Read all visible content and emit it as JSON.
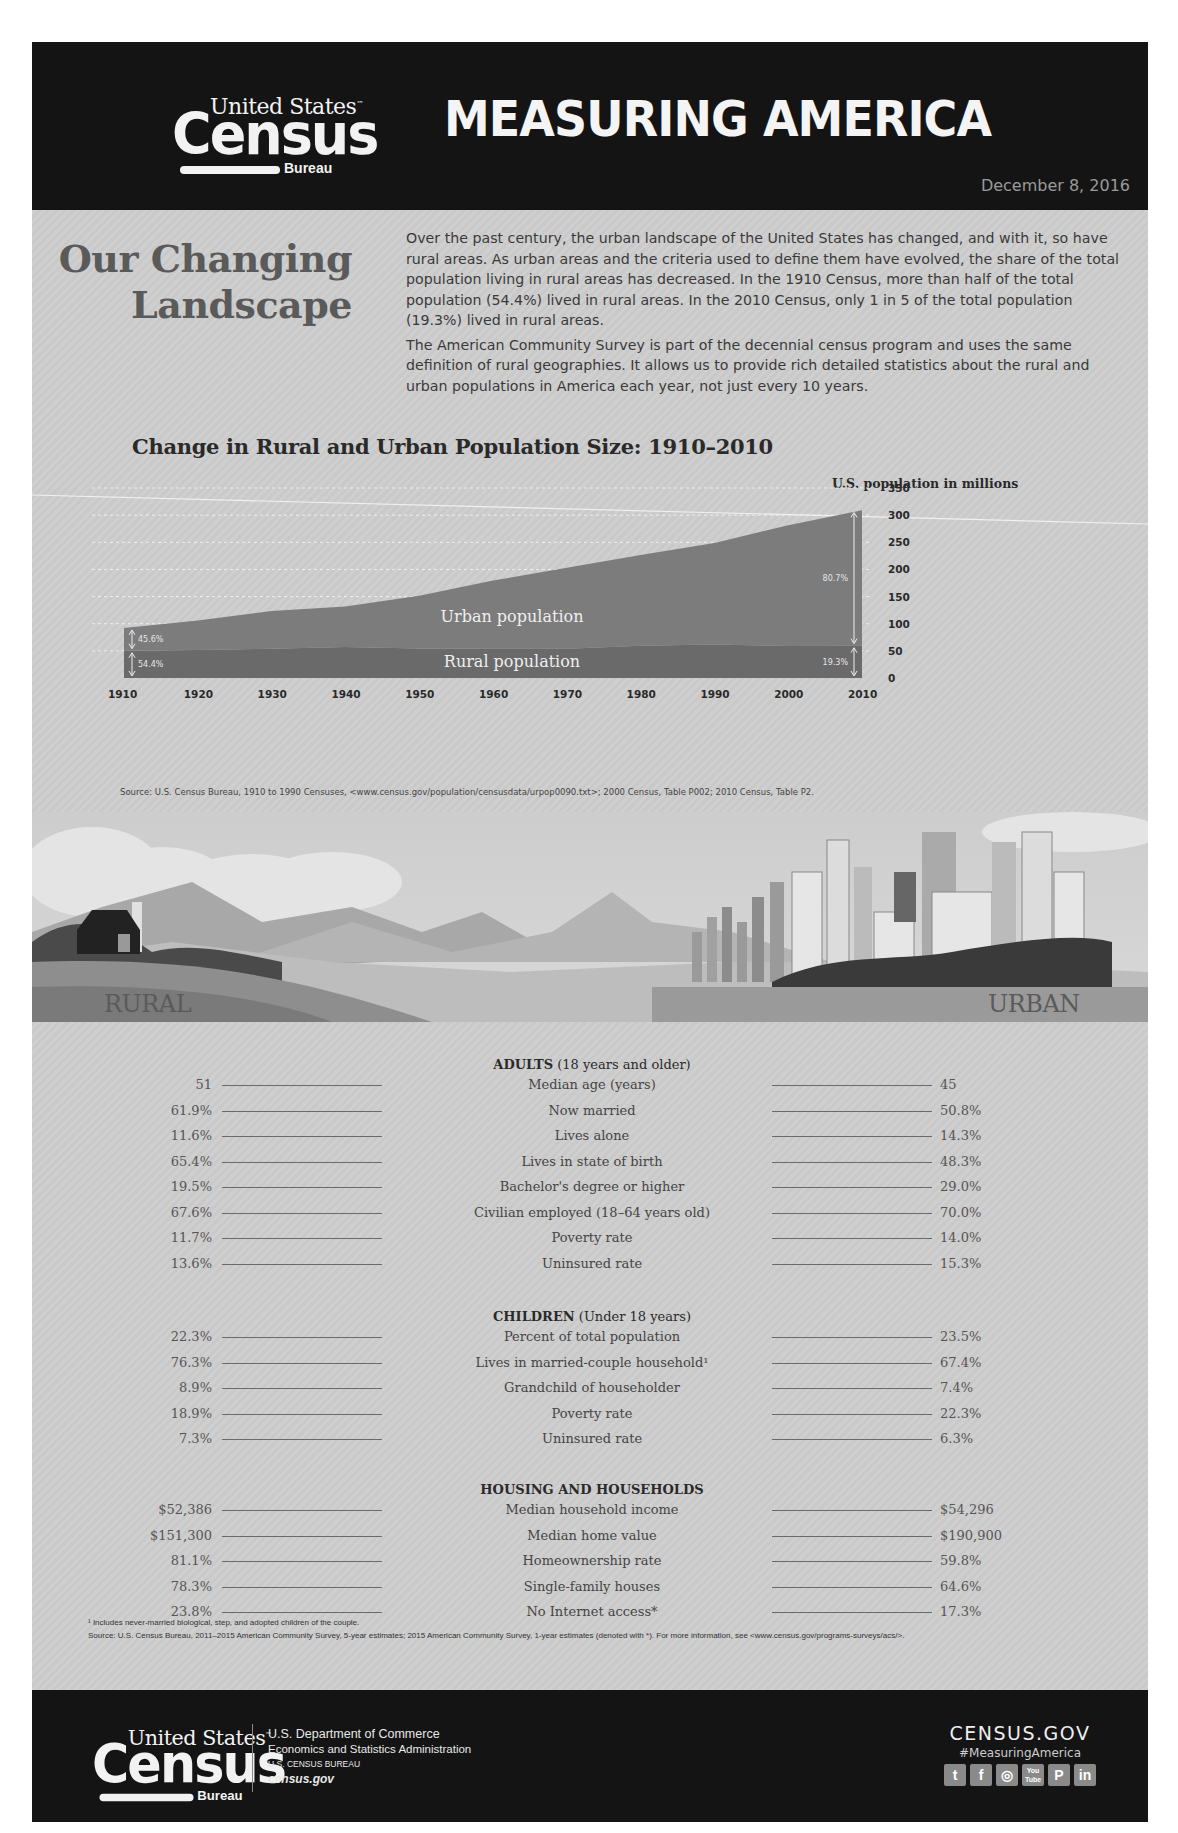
{
  "header": {
    "logo": {
      "line1": "United States",
      "tm": "™",
      "line2": "Census",
      "line3": "Bureau"
    },
    "title": "MEASURING AMERICA",
    "date": "December 8, 2016"
  },
  "intro": {
    "heading_line1": "Our Changing",
    "heading_line2": "Landscape",
    "paragraph1": "Over the past century, the urban landscape of the United States has changed, and with it, so have rural areas. As urban areas and the criteria used to define them have evolved, the share of the total population living in rural areas has decreased. In the 1910 Census, more than half of the total population (54.4%) lived in rural areas. In the 2010 Census, only 1 in 5 of the total population (19.3%) lived in rural areas.",
    "paragraph2": "The American Community Survey is part of the decennial census program and uses the same definition of rural geographies. It allows us to provide rich detailed statistics about the rural and urban populations in America each year, not just every 10 years."
  },
  "chart_data": {
    "type": "area",
    "title": "Change in Rural and Urban Population Size: 1910–2010",
    "xlabel": "",
    "ylabel": "U.S. population in millions",
    "x": [
      1910,
      1920,
      1930,
      1940,
      1950,
      1960,
      1970,
      1980,
      1990,
      2000,
      2010
    ],
    "x_tick_labels": [
      "1910",
      "1920",
      "1930",
      "1940",
      "1950",
      "1960",
      "1970",
      "1980",
      "1990",
      "2000",
      "2010"
    ],
    "y_tick_labels": [
      "0",
      "50",
      "100",
      "150",
      "200",
      "250",
      "300",
      "350"
    ],
    "ylim": [
      0,
      350
    ],
    "stacked": true,
    "grid": "dashed horizontal",
    "series": [
      {
        "name": "Rural population",
        "values": [
          50.2,
          51.6,
          54.0,
          57.2,
          54.5,
          54.1,
          53.9,
          59.5,
          61.7,
          59.1,
          59.5
        ]
      },
      {
        "name": "Urban population",
        "values": [
          42.1,
          54.3,
          69.2,
          74.7,
          96.8,
          125.3,
          149.3,
          167.1,
          187.1,
          222.4,
          249.3
        ]
      }
    ],
    "annotations": [
      {
        "year": 1910,
        "series": "Urban population",
        "label": "45.6%"
      },
      {
        "year": 1910,
        "series": "Rural population",
        "label": "54.4%"
      },
      {
        "year": 2010,
        "series": "Urban population",
        "label": "80.7%"
      },
      {
        "year": 2010,
        "series": "Rural population",
        "label": "19.3%"
      }
    ],
    "source": "Source: U.S. Census Bureau, 1910 to 1990 Censuses, <www.census.gov/population/censusdata/urpop0090.txt>; 2000 Census, Table P002; 2010 Census, Table P2."
  },
  "comparison": {
    "rural_header": "RURAL",
    "urban_header": "URBAN",
    "sections": [
      {
        "title_bold": "ADULTS",
        "title_rest": " (18 years and older)",
        "rows": [
          {
            "label": "Median age (years)",
            "rural": "51",
            "urban": "45"
          },
          {
            "label": "Now married",
            "rural": "61.9%",
            "urban": "50.8%"
          },
          {
            "label": "Lives alone",
            "rural": "11.6%",
            "urban": "14.3%"
          },
          {
            "label": "Lives in state of birth",
            "rural": "65.4%",
            "urban": "48.3%"
          },
          {
            "label": "Bachelor's degree or higher",
            "rural": "19.5%",
            "urban": "29.0%"
          },
          {
            "label": "Civilian employed (18–64 years old)",
            "rural": "67.6%",
            "urban": "70.0%"
          },
          {
            "label": "Poverty rate",
            "rural": "11.7%",
            "urban": "14.0%"
          },
          {
            "label": "Uninsured rate",
            "rural": "13.6%",
            "urban": "15.3%"
          }
        ]
      },
      {
        "title_bold": "CHILDREN",
        "title_rest": " (Under 18 years)",
        "rows": [
          {
            "label": "Percent of total population",
            "rural": "22.3%",
            "urban": "23.5%"
          },
          {
            "label": "Lives in married-couple household¹",
            "rural": "76.3%",
            "urban": "67.4%"
          },
          {
            "label": "Grandchild of householder",
            "rural": "8.9%",
            "urban": "7.4%"
          },
          {
            "label": "Poverty rate",
            "rural": "18.9%",
            "urban": "22.3%"
          },
          {
            "label": "Uninsured rate",
            "rural": "7.3%",
            "urban": "6.3%"
          }
        ]
      },
      {
        "title_bold": "HOUSING AND HOUSEHOLDS",
        "title_rest": "",
        "rows": [
          {
            "label": "Median household income",
            "rural": "$52,386",
            "urban": "$54,296"
          },
          {
            "label": "Median home value",
            "rural": "$151,300",
            "urban": "$190,900"
          },
          {
            "label": "Homeownership rate",
            "rural": "81.1%",
            "urban": "59.8%"
          },
          {
            "label": "Single-family houses",
            "rural": "78.3%",
            "urban": "64.6%"
          },
          {
            "label": "No Internet access*",
            "rural": "23.8%",
            "urban": "17.3%"
          }
        ]
      }
    ],
    "footnote": "¹ Includes never-married biological, step, and adopted children of the couple.",
    "source": "Source: U.S. Census Bureau, 2011–2015 American Community Survey, 5-year estimates; 2015 American Community Survey, 1-year estimates (denoted with *). For more information, see <www.census.gov/programs-surveys/acs/>."
  },
  "footer": {
    "logo": {
      "line1": "United States",
      "tm": "™",
      "line2": "Census",
      "line3": "Bureau"
    },
    "dept_line1": "U.S. Department of Commerce",
    "dept_line2": "Economics and Statistics Administration",
    "dept_line3": "U.S. CENSUS BUREAU",
    "dept_line4": "census.gov",
    "site": "CENSUS.GOV",
    "hashtag": "#MeasuringAmerica",
    "socials": [
      {
        "name": "twitter-icon",
        "glyph": "t"
      },
      {
        "name": "facebook-icon",
        "glyph": "f"
      },
      {
        "name": "instagram-icon",
        "glyph": "◎"
      },
      {
        "name": "youtube-icon",
        "glyph": "You Tube"
      },
      {
        "name": "pinterest-icon",
        "glyph": "P"
      },
      {
        "name": "linkedin-icon",
        "glyph": "in"
      }
    ]
  },
  "colors": {
    "header_bg": "#141414",
    "page_bg": "#cccccc",
    "urban_area": "#7c7c7c",
    "rural_area": "#6a6a6a",
    "heading_gray": "#5a5a5a"
  }
}
